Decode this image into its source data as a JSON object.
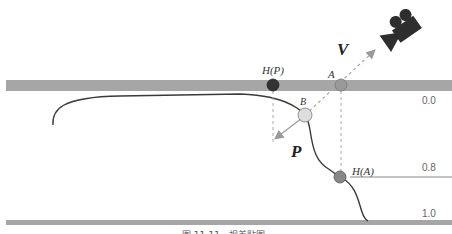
{
  "labels": {
    "hp": "H(P)",
    "a": "A",
    "b": "B",
    "ha": "H(A)",
    "v": "V",
    "p": "P"
  },
  "depth_ticks": [
    "0.0",
    "0.8",
    "1.0"
  ],
  "caption": "图 11-11　视差贴图",
  "colors": {
    "band": "#a6a6a6",
    "curve": "#3a3a3a",
    "hp_point": "#333333",
    "a_point": "#999999",
    "b_point": "#dddddd",
    "ha_point": "#888888",
    "arrow": "#999999",
    "camera": "#2e2e2e"
  },
  "icons": {
    "camera": "movie-camera-icon"
  }
}
